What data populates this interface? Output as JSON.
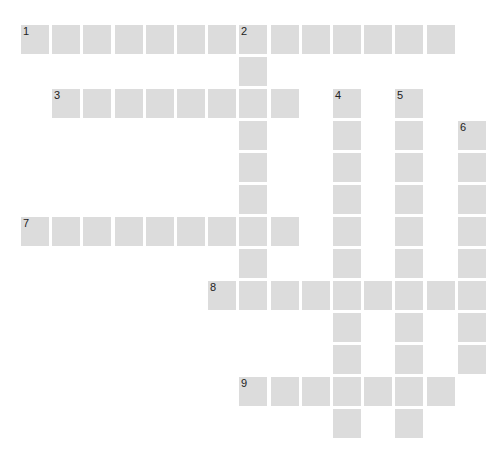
{
  "puzzle": {
    "type": "crossword",
    "rows": 13,
    "cols": 15,
    "cell_color": "#dcdcdc",
    "number_color": "#222222",
    "words": [
      {
        "number": "1",
        "direction": "across",
        "row": 0,
        "col": 0,
        "length": 14
      },
      {
        "number": "2",
        "direction": "down",
        "row": 0,
        "col": 7,
        "length": 8
      },
      {
        "number": "3",
        "direction": "across",
        "row": 2,
        "col": 1,
        "length": 8
      },
      {
        "number": "4",
        "direction": "down",
        "row": 2,
        "col": 10,
        "length": 11
      },
      {
        "number": "5",
        "direction": "down",
        "row": 2,
        "col": 12,
        "length": 11
      },
      {
        "number": "6",
        "direction": "down",
        "row": 3,
        "col": 14,
        "length": 8
      },
      {
        "number": "7",
        "direction": "across",
        "row": 6,
        "col": 0,
        "length": 9
      },
      {
        "number": "8",
        "direction": "across",
        "row": 8,
        "col": 6,
        "length": 9
      },
      {
        "number": "9",
        "direction": "across",
        "row": 11,
        "col": 7,
        "length": 7
      }
    ]
  }
}
